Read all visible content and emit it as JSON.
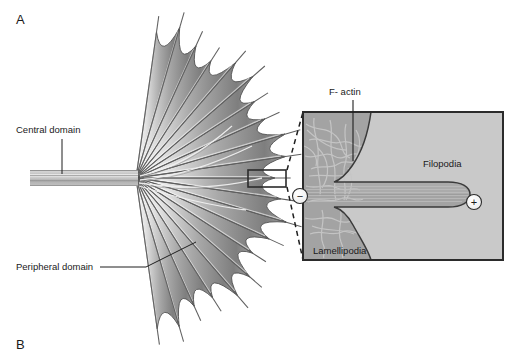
{
  "figure": {
    "background_color": "#ffffff",
    "panels": [
      {
        "letter": "A",
        "x": 16,
        "y": 24
      },
      {
        "letter": "B",
        "x": 16,
        "y": 348
      }
    ]
  },
  "main_diagram": {
    "name": "growth-cone-schematic",
    "callouts": [
      {
        "id": "central-domain",
        "label": "Central domain",
        "text_x": 16,
        "text_y": 133,
        "leader": {
          "x1": 62,
          "y1": 139,
          "x2": 62,
          "y2": 172
        }
      },
      {
        "id": "peripheral-domain",
        "label": "Peripheral domain",
        "text_x": 16,
        "text_y": 270,
        "leader_points": "98,267 145,267 192,243"
      }
    ],
    "central_bundle": {
      "x_start": 30,
      "x_end": 137,
      "y_center": 178,
      "filament_count": 9,
      "color_light": "#d7d7d7",
      "color_dark": "#8f8f8f"
    },
    "fan": {
      "origin_x": 136,
      "origin_y": 178,
      "radius": 152,
      "filopodia_count": 21,
      "angle_start_deg": -82,
      "angle_end_deg": 82,
      "veil_color_light": "#f2f2f2",
      "veil_color_dark": "#8a8a8a",
      "outline_color": "#4a4a4a"
    },
    "callout_box": {
      "x": 248,
      "y": 170,
      "width": 38,
      "height": 17,
      "stroke": "#2b2b2b"
    }
  },
  "inset": {
    "name": "filopodium-ultrastructure-inset",
    "x": 303,
    "y": 112,
    "width": 200,
    "height": 148,
    "border_color": "#2b2b2b",
    "background_color": "#c9c9c9",
    "lamellipodia_color": "#a3a3a3",
    "filopodia_color": "#a3a3a3",
    "actin_mesh_color": "#c4c4c4",
    "labels": {
      "f_actin": "F- actin",
      "filopodia": "Filopodia",
      "lamellipodia": "Lamellipodia"
    },
    "f_actin_leader": {
      "x1": 353,
      "y1": 98,
      "x2": 353,
      "y2": 161
    },
    "f_actin_text_x": 329,
    "f_actin_text_y": 94,
    "filopodia_text_x": 423,
    "filopodia_text_y": 166,
    "lamellipodia_text_x": 313,
    "lamellipodia_text_y": 253,
    "polarity_markers": [
      {
        "id": "minus-end",
        "symbol": "−",
        "cx": 300,
        "cy": 196,
        "r": 7.5
      },
      {
        "id": "plus-end",
        "symbol": "+",
        "cx": 474,
        "cy": 202,
        "r": 7.5
      }
    ],
    "connector_lines": [
      {
        "x1": 286,
        "y1": 171,
        "x2": 303,
        "y2": 112
      },
      {
        "x1": 286,
        "y1": 186,
        "x2": 303,
        "y2": 260
      }
    ]
  }
}
